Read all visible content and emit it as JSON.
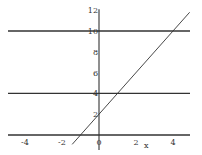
{
  "chart_data": {
    "type": "line",
    "title": "",
    "xlabel": "x",
    "ylabel": "",
    "xlim": [
      -5,
      5
    ],
    "ylim": [
      -1,
      12
    ],
    "grid": false,
    "legend": null,
    "x_ticks": [
      -4,
      -2,
      0,
      2,
      4
    ],
    "y_ticks": [
      2,
      4,
      6,
      8,
      10,
      12
    ],
    "x_tick_labels": [
      "-4",
      "-2",
      "0",
      "2",
      "4"
    ],
    "y_tick_labels": [
      "2",
      "4",
      "6",
      "8",
      "10",
      "12"
    ],
    "series": [
      {
        "name": "y = 2x + 2",
        "kind": "line",
        "x": [
          -1.45,
          4.9
        ],
        "y": [
          -0.9,
          11.8
        ]
      },
      {
        "name": "y = 10",
        "kind": "hline",
        "y_value": 10
      },
      {
        "name": "y = 4",
        "kind": "hline",
        "y_value": 4
      }
    ]
  },
  "colors": {
    "line": "#333333",
    "axis": "#333333",
    "background": "#ffffff"
  }
}
